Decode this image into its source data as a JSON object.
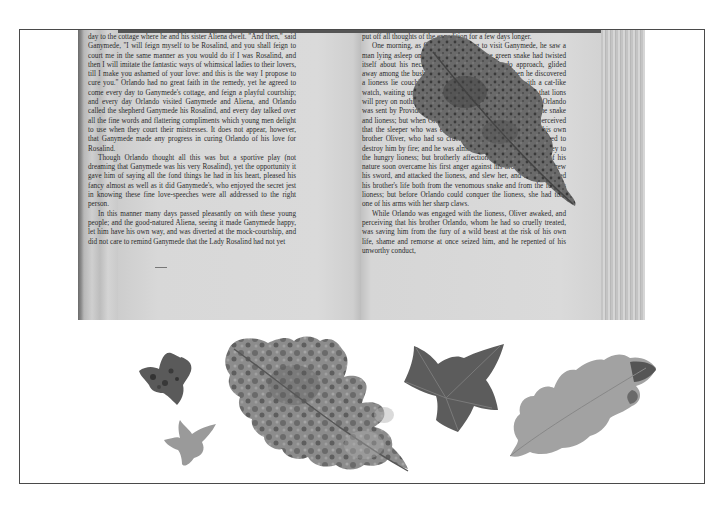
{
  "scene": {
    "description": "Photograph of an open book with pressed autumn leaves, framed",
    "colors": {
      "background": "#ffffff",
      "frame": "#4a4a4a",
      "page": "#d8d8d8",
      "text": "#2b2b2b",
      "leaf_dark": "#555555",
      "leaf_mid": "#8a8a8a",
      "leaf_light": "#a8a8a8"
    }
  },
  "book": {
    "left_page": {
      "paragraphs": [
        "day to the cottage where he and his sister Aliena dwelt. \"And then,\" said Ganymede, \"I will feign myself to be Rosalind, and you shall feign to court me in the same manner as you would do if I was Rosalind, and then I will imitate the fantastic ways of whimsical ladies to their lovers, till I make you ashamed of your love: and this is the way I propose to cure you.\" Orlando had no great faith in the remedy, yet he agreed to come every day to Ganymede's cottage, and feign a playful courtship; and every day Orlando visited Ganymede and Aliena, and Orlando called the shepherd Ganymede his Rosalind, and every day talked over all the fine words and flattering compliments which young men delight to use when they court their mistresses. It does not appear, however, that Ganymede made any progress in curing Orlando of his love for Rosalind.",
        "Though Orlando thought all this was but a sportive play (not dreaming that Ganymede was his very Rosalind), yet the opportunity it gave him of saying all the fond things he had in his heart, pleased his fancy almost as well as it did Ganymede's, who enjoyed the secret jest in knowing these fine love-speeches were all addressed to the right person.",
        "In this manner many days passed pleasantly on with these young people; and the good-natured Aliena, seeing it made Ganymede happy, let him have his own way, and was diverted at the mock-courtship, and did not care to remind Ganymede that the Lady Rosalind had not yet"
      ]
    },
    "right_page": {
      "paragraphs": [
        "put off all thoughts of the expedition for a few days longer.",
        "One morning, as Orlando was going to visit Ganymede, he saw a man lying asleep on the ground, and a large green snake had twisted itself about his neck. The snake, seeing Orlando approach, glided away among the bushes. Orlando went nearer, and then he discovered a lioness lie couching, with her head on the ground, with a cat-like watch, waiting until the sleeping man awaked (for it is said that lions will prey on nothing that is dead or sleeping). It seemed as if Orlando was sent by Providence to free the man from the danger of the snake and lioness; but when Orlando looked in the man's face, he perceived that the sleeper who was exposed to this double peril, was his own brother Oliver, who had so cruelly used him, and had threatened to destroy him by fire; and he was almost tempted to leave him a prey to the hungry lioness; but brotherly affection and the gentleness of his nature soon overcame his first anger against his brother; and he drew his sword, and attacked the lioness, and slew her, and thus preserved his brother's life both from the venomous snake and from the furious lioness; but before Orlando could conquer the lioness, she had torn one of his arms with her sharp claws.",
        "While Orlando was engaged with the lioness, Oliver awaked, and perceiving that his brother Orlando, whom he had so cruelly treated, was saving him from the fury of a wild beast at the risk of his own life, shame and remorse at once seized him, and he repented of his unworthy conduct,"
      ]
    }
  },
  "leaves": [
    {
      "name": "oak-leaf-on-book",
      "shade": "dark"
    },
    {
      "name": "small-ivy-leaf-dark",
      "shade": "dark"
    },
    {
      "name": "small-ivy-leaf-light",
      "shade": "light"
    },
    {
      "name": "large-oak-leaf",
      "shade": "mottled"
    },
    {
      "name": "ivy-leaf",
      "shade": "dark"
    },
    {
      "name": "oak-leaf-right",
      "shade": "light"
    }
  ]
}
